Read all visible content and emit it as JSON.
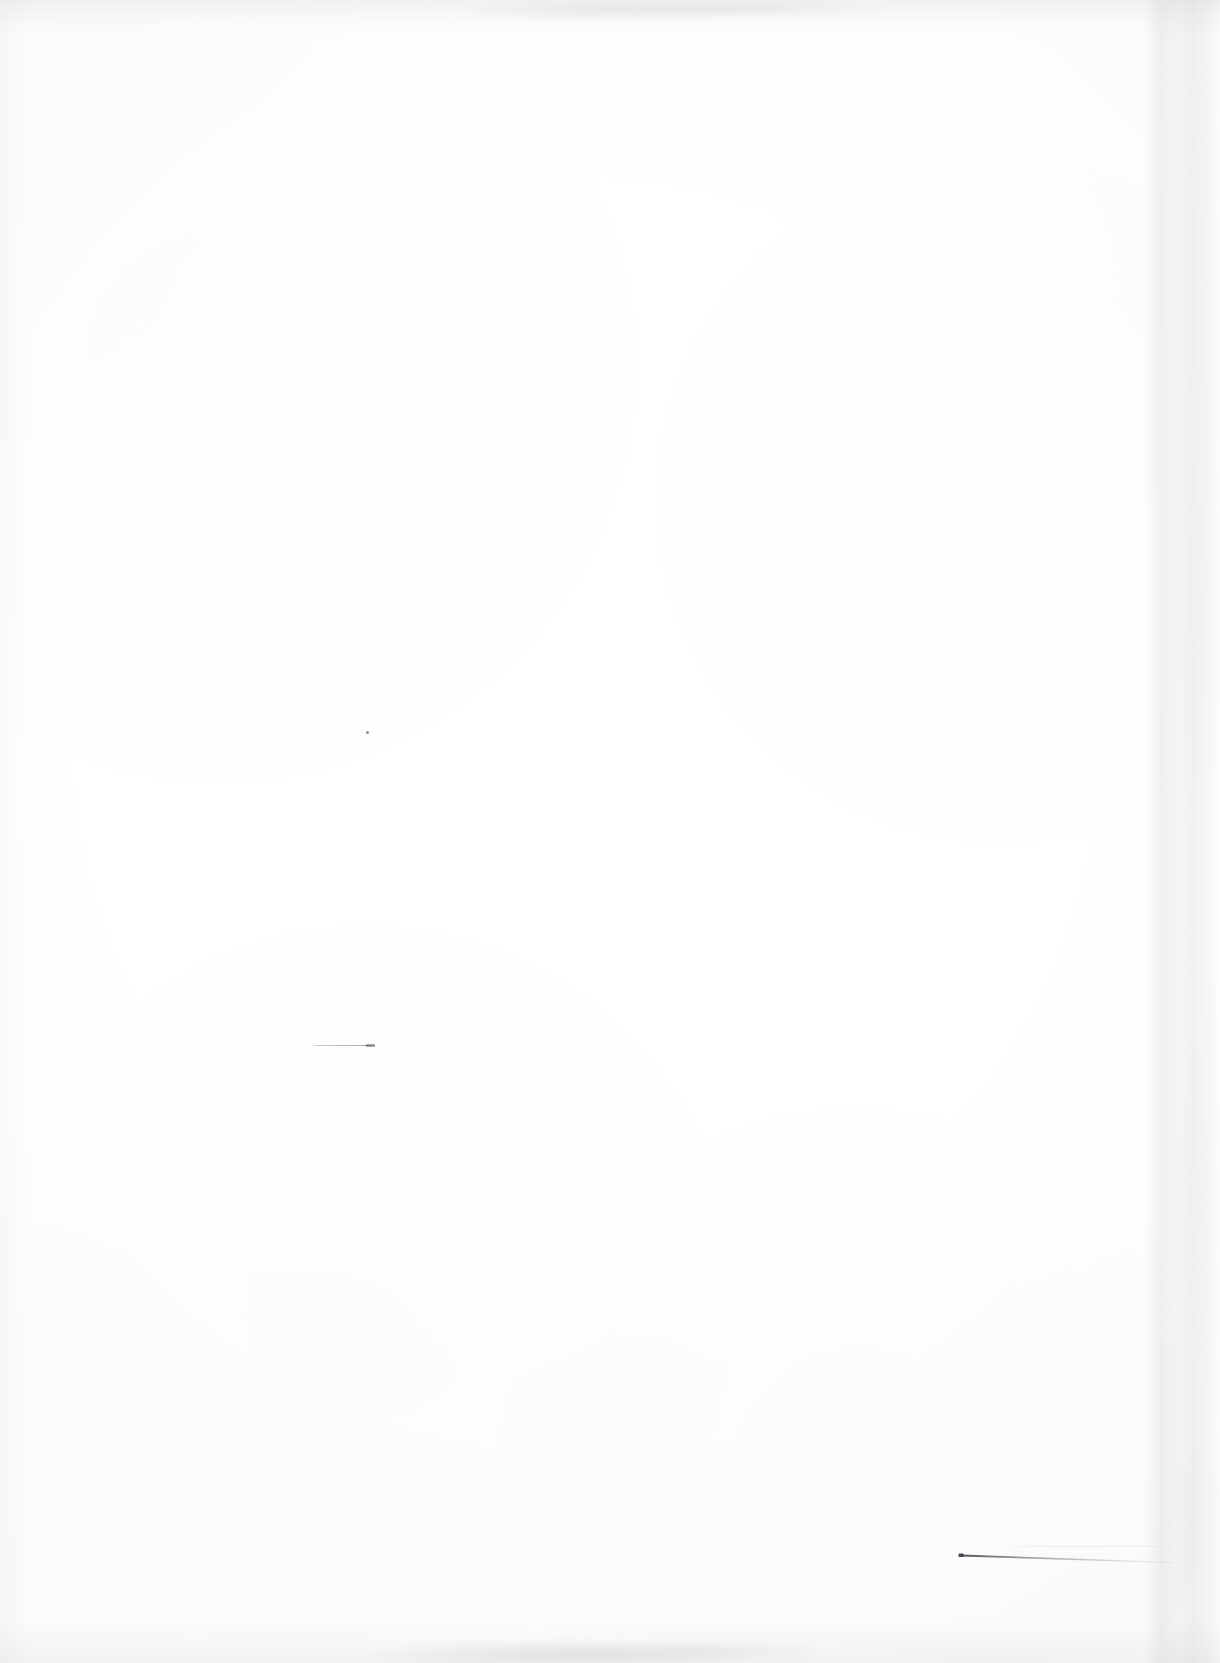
{
  "document": {
    "kind": "scanned-page",
    "state": "blank",
    "page_width": 1220,
    "page_height": 1663,
    "background_color": "#ffffff",
    "paper_tone": "#fdfdfd",
    "text_content": "",
    "visible_text_lines": []
  },
  "scan_artifacts": {
    "edge_shadow_color": "#7a7a80",
    "edges": [
      {
        "name": "top-edge-shadow",
        "position": "top",
        "thickness_px": 34,
        "description": "faint grey mottled scanner shadow band"
      },
      {
        "name": "bottom-edge-shadow",
        "position": "bottom",
        "thickness_px": 42,
        "description": "faint grey mottled scanner shadow band"
      },
      {
        "name": "left-edge-shadow",
        "position": "left",
        "thickness_px": 30,
        "description": "subtle grey gradient along left border"
      },
      {
        "name": "right-edge-band",
        "position": "right",
        "thickness_px": 78,
        "description": "soft light-grey vertical band near right border"
      }
    ]
  },
  "marks": [
    {
      "name": "speck",
      "shape": "dot",
      "x": 368,
      "y": 733,
      "size_px": 3,
      "color": "#464650",
      "description": "tiny dark speck in the upper middle-left of the page"
    },
    {
      "name": "short-stroke",
      "shape": "horizontal-line",
      "x_start": 313,
      "x_end": 375,
      "y": 1046,
      "length_px": 62,
      "color": "#82828c",
      "description": "faint short grey horizontal stroke with a slightly darker tick at its right end"
    },
    {
      "name": "long-tapering-line",
      "shape": "tapering-line-with-end-dot",
      "x_start": 960,
      "y_start": 1555,
      "x_end": 1182,
      "y_end": 1563,
      "length_px": 222,
      "color": "#3c3c46",
      "description": "thin dark line beginning with a small dark dot at its left end, extending right and slightly downward while fading toward the right edge"
    }
  ]
}
